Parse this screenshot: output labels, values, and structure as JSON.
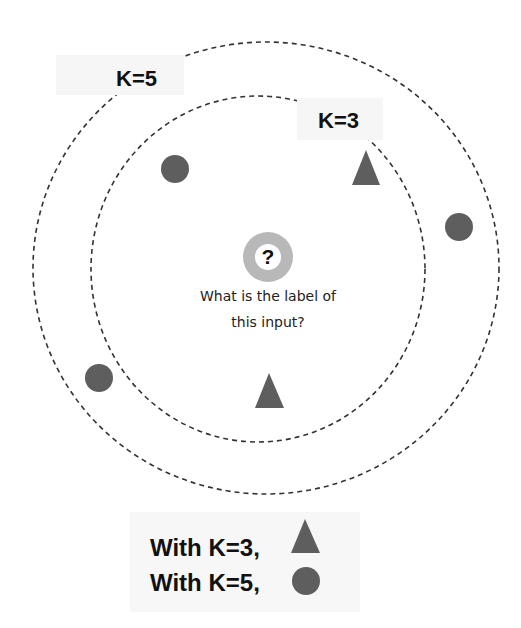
{
  "diagram": {
    "labels": {
      "k5": "K=5",
      "k3": "K=3",
      "query_symbol": "?",
      "query_question_line1": "What is the label of",
      "query_question_line2": "this input?"
    },
    "circles": [
      {
        "name": "k5-boundary",
        "cx": 266,
        "cy": 268,
        "rx": 233,
        "ry": 226,
        "style": "dashed"
      },
      {
        "name": "k3-boundary",
        "cx": 258,
        "cy": 269,
        "rx": 167,
        "ry": 173,
        "style": "dashed"
      }
    ],
    "points": [
      {
        "shape": "circle",
        "x": 175,
        "y": 169,
        "within": "K=3"
      },
      {
        "shape": "triangle",
        "x": 366,
        "y": 168,
        "within": "K=3"
      },
      {
        "shape": "triangle",
        "x": 269,
        "y": 391,
        "within": "K=3"
      },
      {
        "shape": "circle",
        "x": 459,
        "y": 227,
        "within": "K=5"
      },
      {
        "shape": "circle",
        "x": 99,
        "y": 378,
        "within": "K=5"
      }
    ],
    "query_point": {
      "x": 268,
      "y": 257
    },
    "colors": {
      "shape_fill": "#5e5e5e",
      "query_ring": "#b8b8b8",
      "dash": "#333333",
      "label_bg": "#f6f6f6"
    }
  },
  "legend": {
    "rows": [
      {
        "text": "With K=3,",
        "result_shape": "triangle"
      },
      {
        "text": "With K=5,",
        "result_shape": "circle"
      }
    ]
  }
}
